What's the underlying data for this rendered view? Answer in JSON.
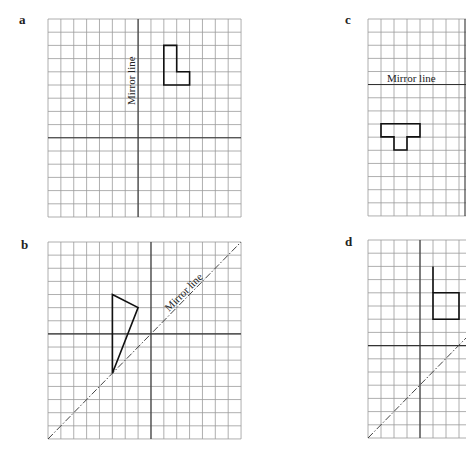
{
  "panels": [
    {
      "id": "a",
      "label": "a",
      "mirror_label": "Mirror line",
      "mirror_orientation": "vertical",
      "grid": {
        "cols": 15,
        "rows": 15
      },
      "shape": "L-shape",
      "shape_points": [
        [
          9,
          2
        ],
        [
          10,
          2
        ],
        [
          10,
          4
        ],
        [
          11,
          4
        ],
        [
          11,
          5
        ],
        [
          9,
          5
        ]
      ]
    },
    {
      "id": "b",
      "label": "b",
      "mirror_label": "Mirror line",
      "mirror_orientation": "diagonal",
      "grid": {
        "cols": 15,
        "rows": 15
      },
      "shape": "triangle",
      "shape_points": [
        [
          5,
          4
        ],
        [
          7,
          5
        ],
        [
          5,
          10
        ]
      ]
    },
    {
      "id": "c",
      "label": "c",
      "mirror_label": "Mirror line",
      "mirror_orientation": "horizontal",
      "grid": {
        "cols": 7,
        "rows": 15
      },
      "shape": "T-shape",
      "shape_points": [
        [
          1,
          8
        ],
        [
          4,
          8
        ],
        [
          4,
          9
        ],
        [
          3,
          9
        ],
        [
          3,
          10
        ],
        [
          2,
          10
        ],
        [
          2,
          9
        ],
        [
          1,
          9
        ]
      ]
    },
    {
      "id": "d",
      "label": "d",
      "mirror_label": "",
      "mirror_orientation": "diagonal",
      "grid": {
        "cols": 7,
        "rows": 15
      },
      "shape": "square-with-line",
      "shape_points": [
        [
          5,
          4
        ],
        [
          7,
          4
        ],
        [
          7,
          6
        ],
        [
          5,
          6
        ]
      ]
    }
  ],
  "colors": {
    "grid": "#9a9a9a",
    "axis": "#333333",
    "shape": "#111111"
  }
}
